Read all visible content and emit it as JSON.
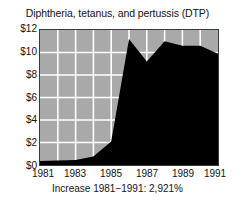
{
  "chart_data": {
    "type": "area",
    "title": "Diphtheria, tetanus, and pertussis (DTP)",
    "caption": "Increase 1981−1991: 2,921%",
    "xlabel": "",
    "ylabel": "",
    "ylim": [
      0,
      12
    ],
    "xlim": [
      1981,
      1991
    ],
    "grid": true,
    "legend": "none",
    "y_ticks": [
      0,
      2,
      4,
      6,
      8,
      10,
      12
    ],
    "y_tick_labels": [
      "$0",
      "$2",
      "$4",
      "$6",
      "$8",
      "$10",
      "$12"
    ],
    "x_ticks": [
      1981,
      1983,
      1985,
      1987,
      1989,
      1991
    ],
    "x_tick_labels": [
      "1981",
      "1983",
      "1985",
      "1987",
      "1989",
      "1991"
    ],
    "x": [
      1981,
      1982,
      1983,
      1984,
      1985,
      1986,
      1987,
      1988,
      1989,
      1990,
      1991
    ],
    "values": [
      0.35,
      0.4,
      0.45,
      0.75,
      2.1,
      11.2,
      9.2,
      11.0,
      10.6,
      10.6,
      9.9
    ],
    "series_name": "DTP vaccine price",
    "area_color": "#000000",
    "plot_background": "#a9a9a9",
    "gridline_color": "#ffffff"
  },
  "figure": {
    "title": "Diphtheria, tetanus, and pertussis (DTP)",
    "caption": "Increase 1981−1991: 2,921%"
  }
}
